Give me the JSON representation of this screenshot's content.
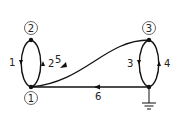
{
  "diagram": {
    "type": "directed-graph",
    "nodes": [
      {
        "id": "1",
        "label": "1",
        "circled": true
      },
      {
        "id": "2",
        "label": "2",
        "circled": true
      },
      {
        "id": "3",
        "label": "3",
        "circled": true
      },
      {
        "id": "ground",
        "label": "",
        "symbol": "ground"
      }
    ],
    "edges": [
      {
        "label": "1",
        "from": "2",
        "to": "1"
      },
      {
        "label": "2",
        "from": "1",
        "to": "2"
      },
      {
        "label": "3",
        "from": "3",
        "to": "ground"
      },
      {
        "label": "4",
        "from": "ground",
        "to": "3"
      },
      {
        "label": "5",
        "from": "3",
        "to": "1"
      },
      {
        "label": "6",
        "from": "ground",
        "to": "1"
      }
    ],
    "colors": {
      "stroke": "#111111",
      "node_circle": "#555555"
    }
  }
}
